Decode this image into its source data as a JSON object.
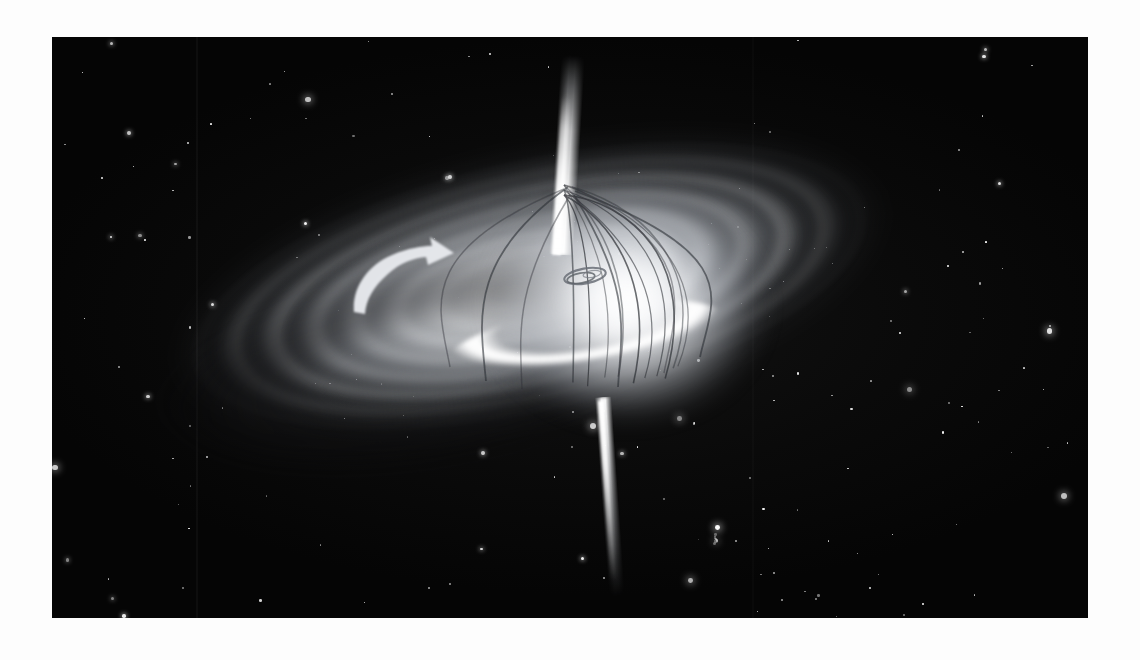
{
  "page": {
    "medium": "grayscale astronomical artist illustration",
    "background_color": "#ffffff",
    "plate_color": "#050505"
  },
  "plate": {
    "left": 52,
    "top": 37,
    "width": 1036,
    "height": 581,
    "seams": [
      {
        "name": "scan-seam-left",
        "x": 144
      },
      {
        "name": "scan-seam-right",
        "x": 700
      }
    ]
  },
  "scene": {
    "objects": [
      {
        "name": "starfield",
        "label": "Background star field"
      },
      {
        "name": "accretion-disk",
        "label": "Accretion disk"
      },
      {
        "name": "disk-spiral-bands",
        "label": "Concentric disk bands"
      },
      {
        "name": "bright-inner-rim",
        "label": "Bright inner rim arc"
      },
      {
        "name": "central-bulge",
        "label": "Glowing central bulge"
      },
      {
        "name": "black-hole-ring",
        "label": "Inner black hole ring"
      },
      {
        "name": "magnetic-field-lines",
        "label": "Magnetic field lines"
      },
      {
        "name": "jet-upper",
        "label": "Upper relativistic jet"
      },
      {
        "name": "jet-lower",
        "label": "Lower relativistic jet"
      },
      {
        "name": "rotation-arrow",
        "label": "Disk rotation direction arrow"
      },
      {
        "name": "faint-galaxy",
        "label": "Faint background cluster"
      }
    ],
    "disk": {
      "center_x": 478,
      "center_y": 248,
      "rotation_deg": -13,
      "outer_width": 800,
      "outer_height": 300,
      "band_count": 5
    },
    "black_hole_ring": {
      "center_x": 533,
      "center_y": 239,
      "rx": 20,
      "ry": 7,
      "rotation_deg": -10
    },
    "rotation_arrow": {
      "direction": "counterclockwise-as-seen",
      "tip_x": 363,
      "tip_y": 218,
      "color": "#e8eaee"
    },
    "field_lines": {
      "count": 10,
      "apex_x": 512,
      "apex_y": 148,
      "base_y": 325,
      "color": "#2b2e33",
      "stroke_width": 1.6
    },
    "jets": {
      "upper": {
        "base_x": 512,
        "base_y": 218,
        "tip_y": 55,
        "tilt_deg": 3.5
      },
      "lower": {
        "base_x": 551,
        "base_y": 362,
        "tip_y": 545,
        "tilt_deg": -4
      }
    }
  },
  "colors": {
    "space_black": "#050505",
    "disk_white": "#ffffff",
    "disk_gray": "#9aa0a8",
    "field_line": "#2b2e33",
    "star_white": "#ffffff",
    "page_white": "#ffffff"
  },
  "starfield": {
    "count": 186,
    "seed": 20240117,
    "note": "soft white point sources of varying size and glow"
  }
}
